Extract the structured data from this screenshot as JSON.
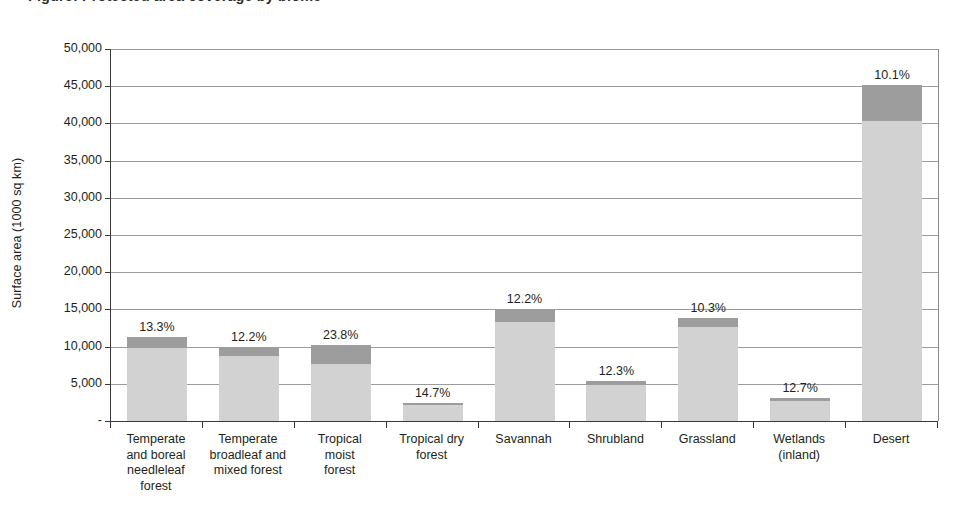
{
  "figure": {
    "cropped_title": "Figure: Protected area coverage by biome",
    "y_axis_title": "Surface area (1000 sq km)"
  },
  "chart_data": {
    "type": "bar",
    "title": "",
    "xlabel": "",
    "ylabel": "Surface area (1000 sq km)",
    "ylim": [
      0,
      50000
    ],
    "ytick_values": [
      0,
      5000,
      10000,
      15000,
      20000,
      25000,
      30000,
      35000,
      40000,
      45000,
      50000
    ],
    "ytick_labels": [
      "-",
      "5,000",
      "10,000",
      "15,000",
      "20,000",
      "25,000",
      "30,000",
      "35,000",
      "40,000",
      "45,000",
      "50,000"
    ],
    "grid": true,
    "legend": "none",
    "stacked": true,
    "categories": [
      "Temperate and boreal needleleaf forest",
      "Temperate broadleaf and mixed forest",
      "Tropical moist forest",
      "Tropical dry forest",
      "Savannah",
      "Shrubland",
      "Grassland",
      "Wetlands (inland)",
      "Desert"
    ],
    "category_label_lines": [
      [
        "Temperate",
        "and boreal",
        "needleleaf",
        "forest"
      ],
      [
        "Temperate",
        "broadleaf and",
        "mixed forest"
      ],
      [
        "Tropical",
        "moist",
        "forest"
      ],
      [
        "Tropical dry",
        "forest"
      ],
      [
        "Savannah"
      ],
      [
        "Shrubland"
      ],
      [
        "Grassland"
      ],
      [
        "Wetlands",
        "(inland)"
      ],
      [
        "Desert"
      ]
    ],
    "series": [
      {
        "name": "Unprotected area",
        "color": "#d2d2d2",
        "values": [
          9800,
          8800,
          7700,
          2100,
          13300,
          4800,
          12600,
          2700,
          40300
        ]
      },
      {
        "name": "Protected area",
        "color": "#9d9d9d",
        "values": [
          1500,
          1200,
          2500,
          300,
          1800,
          600,
          1300,
          400,
          4900
        ]
      }
    ],
    "totals": [
      11300,
      10000,
      10200,
      2400,
      15100,
      5400,
      13900,
      3100,
      45200
    ],
    "data_labels": [
      "13.3%",
      "12.2%",
      "23.8%",
      "14.7%",
      "12.2%",
      "12.3%",
      "10.3%",
      "12.7%",
      "10.1%"
    ],
    "data_label_values": [
      13.3,
      12.2,
      23.8,
      14.7,
      12.2,
      12.3,
      10.3,
      12.7,
      10.1
    ],
    "data_label_unit": "%"
  },
  "colors": {
    "bar_low": "#d2d2d2",
    "bar_high": "#9d9d9d",
    "gridline": "#9b9b9b",
    "axis": "#3a3a3a",
    "text": "#231f20",
    "background": "#ffffff"
  }
}
